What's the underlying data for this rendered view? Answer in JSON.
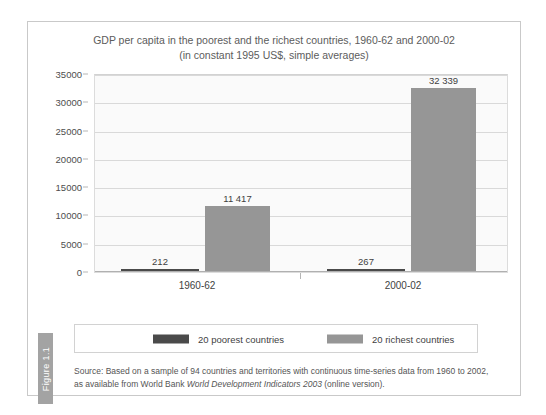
{
  "figure": {
    "tab_label": "Figure 1.1"
  },
  "chart_data": {
    "type": "bar",
    "title_line1": "GDP per capita in the poorest and the richest countries, 1960-62 and 2000-02",
    "title_line2": "(in constant 1995 US$, simple averages)",
    "xlabel": "",
    "ylabel": "",
    "ylim": [
      0,
      35000
    ],
    "ytick_step": 5000,
    "yticks": [
      "0",
      "5000",
      "10000",
      "15000",
      "20000",
      "25000",
      "30000",
      "35000"
    ],
    "ytick_values": [
      0,
      5000,
      10000,
      15000,
      20000,
      25000,
      30000,
      35000
    ],
    "grid": true,
    "legend_position": "bottom",
    "categories": [
      "1960-62",
      "2000-02"
    ],
    "series": [
      {
        "name": "20 poorest countries",
        "color": "#4a4a4a",
        "values": [
          212,
          267
        ],
        "labels": [
          "212",
          "267"
        ]
      },
      {
        "name": "20 richest countries",
        "color": "#969696",
        "values": [
          11417,
          32339
        ],
        "labels": [
          "11 417",
          "32 339"
        ]
      }
    ],
    "source_prefix": "Source: Based on a sample of 94 countries and territories with continuous time-series data from 1960 to 2002, as available from World Bank ",
    "source_italic": "World Development Indicators 2003",
    "source_suffix": " (online version)."
  }
}
